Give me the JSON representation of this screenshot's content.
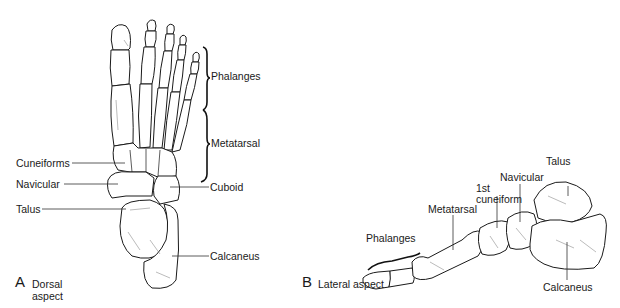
{
  "figure": {
    "panel_a": {
      "letter": "A",
      "caption_line1": "Dorsal",
      "caption_line2": "aspect",
      "labels": {
        "phalanges": "Phalanges",
        "metatarsal": "Metatarsal",
        "cuneiforms": "Cuneiforms",
        "navicular": "Navicular",
        "cuboid": "Cuboid",
        "talus": "Talus",
        "calcaneus": "Calcaneus"
      }
    },
    "panel_b": {
      "letter": "B",
      "caption": "Lateral aspect",
      "labels": {
        "talus": "Talus",
        "navicular": "Navicular",
        "first_cuneiform_line1": "1st",
        "first_cuneiform_line2": "cuneiform",
        "metatarsal": "Metatarsal",
        "phalanges": "Phalanges",
        "calcaneus": "Calcaneus"
      }
    }
  }
}
